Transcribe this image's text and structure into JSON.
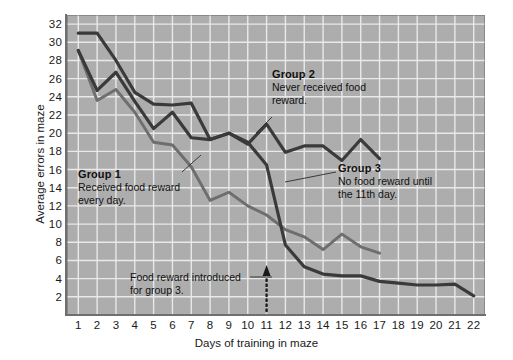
{
  "chart_data": {
    "type": "line",
    "title": "",
    "xlabel": "Days of training in maze",
    "ylabel": "Average errors in maze",
    "xlim": [
      0.4,
      22.6
    ],
    "ylim": [
      0,
      33
    ],
    "xticks": [
      1,
      2,
      3,
      4,
      5,
      6,
      7,
      8,
      9,
      10,
      11,
      12,
      13,
      14,
      15,
      16,
      17,
      18,
      19,
      20,
      21,
      22
    ],
    "yticks": [
      2,
      4,
      6,
      8,
      10,
      12,
      14,
      16,
      18,
      20,
      22,
      24,
      26,
      28,
      30,
      32
    ],
    "grid": true,
    "legend_position": "inline-annotations",
    "plot_background": "#adadad",
    "gridline_color": "#e9e9e9",
    "series": [
      {
        "name": "Group 1",
        "color": "#6e6e6e",
        "x": [
          1,
          2,
          3,
          4,
          5,
          6,
          7,
          8,
          9,
          10,
          11,
          12,
          13,
          14,
          15,
          16,
          17
        ],
        "values": [
          29.1,
          23.6,
          24.8,
          22.3,
          19.0,
          18.7,
          16.3,
          12.6,
          13.5,
          12.0,
          11.0,
          9.4,
          8.6,
          7.2,
          8.9,
          7.5,
          6.8
        ]
      },
      {
        "name": "Group 2",
        "color": "#3a3a3a",
        "x": [
          1,
          2,
          3,
          4,
          5,
          6,
          7,
          8,
          9,
          10,
          11,
          12,
          13,
          14,
          15,
          16,
          17
        ],
        "values": [
          31.0,
          31.0,
          28.0,
          24.5,
          23.2,
          23.1,
          23.3,
          19.3,
          20.0,
          18.8,
          21.0,
          17.9,
          18.6,
          18.6,
          17.0,
          19.3,
          17.2
        ]
      },
      {
        "name": "Group 3",
        "color": "#3a3a3a",
        "x": [
          1,
          2,
          3,
          4,
          5,
          6,
          7,
          8,
          9,
          10,
          11,
          12,
          13,
          14,
          15,
          16,
          17,
          18,
          19,
          20,
          21,
          22
        ],
        "values": [
          29.1,
          24.7,
          26.7,
          23.5,
          20.5,
          22.3,
          19.5,
          19.3,
          20.0,
          19.0,
          16.5,
          7.7,
          5.3,
          4.5,
          4.3,
          4.3,
          3.7,
          3.5,
          3.3,
          3.3,
          3.4,
          2.1
        ]
      }
    ],
    "annotations": [
      {
        "id": "group1",
        "heading": "Group 1",
        "lines": [
          "Received food reward",
          "every day."
        ],
        "points_to_series": "Group 1"
      },
      {
        "id": "group2",
        "heading": "Group 2",
        "lines": [
          "Never received food",
          "reward."
        ],
        "points_to_series": "Group 2"
      },
      {
        "id": "group3",
        "heading": "Group 3",
        "lines": [
          "No food reward until",
          "the 11th day."
        ],
        "points_to_series": "Group 3"
      },
      {
        "id": "intro",
        "heading": "",
        "lines": [
          "Food reward introduced",
          "for group 3."
        ],
        "marker": "dotted-up-arrow-at-day-11"
      }
    ]
  },
  "axis": {
    "y_title": "Average errors in maze",
    "x_title": "Days of training in maze",
    "y_ticks": [
      "32",
      "30",
      "28",
      "26",
      "24",
      "22",
      "20",
      "18",
      "16",
      "14",
      "12",
      "10",
      "8",
      "6",
      "4",
      "2"
    ],
    "x_ticks": [
      "1",
      "2",
      "3",
      "4",
      "5",
      "6",
      "7",
      "8",
      "9",
      "10",
      "11",
      "12",
      "13",
      "14",
      "15",
      "16",
      "17",
      "18",
      "19",
      "20",
      "21",
      "22"
    ]
  },
  "annotations": {
    "group1": {
      "heading": "Group 1",
      "line1": "Received food reward",
      "line2": "every day."
    },
    "group2": {
      "heading": "Group 2",
      "line1": "Never received food",
      "line2": "reward."
    },
    "group3": {
      "heading": "Group 3",
      "line1": "No food reward until",
      "line2": "the 11th day."
    },
    "intro": {
      "line1": "Food reward introduced",
      "line2": "for group 3."
    }
  },
  "colors": {
    "plot_bg": "#adadad",
    "grid": "#e9e9e9",
    "group1_line": "#6e6e6e",
    "group2_line": "#3a3a3a",
    "group3_line": "#3a3a3a",
    "text": "#1a1a1a"
  }
}
